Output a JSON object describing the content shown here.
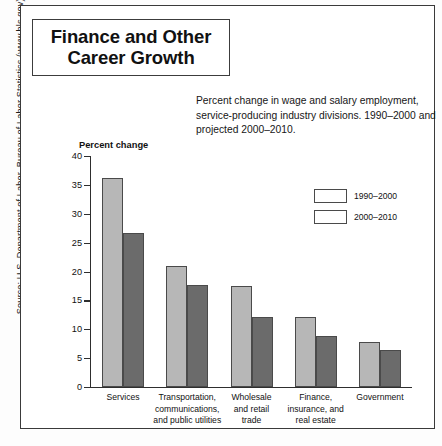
{
  "source_credit": "Source: U.S. Department of Labor, Bureau of Labor Statistics (www.bls.gov).",
  "title": {
    "line1": "Finance and Other",
    "line2": "Career Growth"
  },
  "subtitle": "Percent change in wage and salary employment, service-producing industry divisions. 1990–2000 and projected 2000–2010.",
  "colors": {
    "series1": "#b7b7b7",
    "series2": "#6b6b6b",
    "axis": "#2e2e2e",
    "frame": "#3a3a3a"
  },
  "chart_data": {
    "type": "bar",
    "title": "Percent change",
    "xlabel": "",
    "ylabel": "Percent change",
    "ylim": [
      0,
      40
    ],
    "yticks": [
      40,
      35,
      30,
      25,
      20,
      15,
      10,
      5,
      0
    ],
    "ytick_labels": [
      "40",
      "35",
      "30",
      "25",
      "20",
      "15",
      "10",
      "5",
      "0"
    ],
    "grid": false,
    "legend_position": "right",
    "categories": [
      "Services",
      "Transportation, communications, and public utilities",
      "Wholesale and retail trade",
      "Finance, insurance, and real estate",
      "Government"
    ],
    "category_lines": [
      [
        "Services"
      ],
      [
        "Transportation,",
        "communications,",
        "and public utilities"
      ],
      [
        "Wholesale",
        "and retail",
        "trade"
      ],
      [
        "Finance,",
        "insurance, and",
        "real estate"
      ],
      [
        "Government"
      ]
    ],
    "series": [
      {
        "name": "1990–2000",
        "values": [
          36.2,
          21.0,
          17.5,
          12.2,
          7.8
        ]
      },
      {
        "name": "2000–2010",
        "values": [
          26.6,
          17.7,
          12.2,
          8.8,
          6.4
        ]
      }
    ]
  }
}
